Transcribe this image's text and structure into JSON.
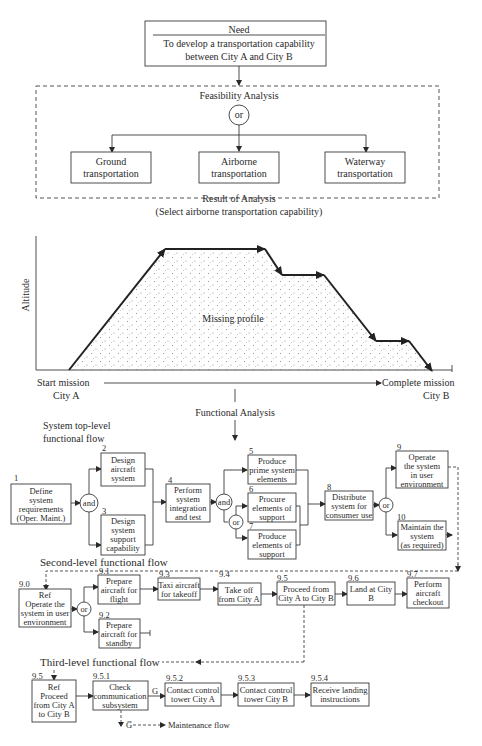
{
  "need": {
    "title": "Need",
    "line1": "To develop a transportation capability",
    "line2": "between City A and City B"
  },
  "feasibility": {
    "title": "Feasibility Analysis",
    "gate": "or",
    "options": [
      {
        "line1": "Ground",
        "line2": "transportation"
      },
      {
        "line1": "Airborne",
        "line2": "transportation"
      },
      {
        "line1": "Waterway",
        "line2": "transportation"
      }
    ],
    "result_title": "Result of Analysis",
    "result_detail": "(Select airborne transportation capability)"
  },
  "profile": {
    "y_axis_label": "Altitude",
    "area_label": "Missing profile",
    "start_line1": "Start mission",
    "start_line2": "City A",
    "end_line1": "Complete mission",
    "end_line2": "City B"
  },
  "functional_analysis": {
    "title": "Functional Analysis"
  },
  "top_level": {
    "title_line1": "System top-level",
    "title_line2": "functional flow",
    "gate_and_1": "and",
    "gate_and_2": "and",
    "gate_or_1": "or",
    "gate_or_2": "or",
    "blocks": [
      {
        "num": "1",
        "lines": [
          "Define",
          "system",
          "requirements",
          "(Oper. Maint.)"
        ]
      },
      {
        "num": "2",
        "lines": [
          "Design",
          "aircraft",
          "system"
        ]
      },
      {
        "num": "3",
        "lines": [
          "Design",
          "system",
          "support",
          "capability"
        ]
      },
      {
        "num": "4",
        "lines": [
          "Perform",
          "system",
          "integration",
          "and test"
        ]
      },
      {
        "num": "5",
        "lines": [
          "Produce",
          "prime system",
          "elements"
        ]
      },
      {
        "num": "6",
        "lines": [
          "Procure",
          "elements of",
          "support"
        ]
      },
      {
        "num": "7",
        "lines": [
          "Produce",
          "elements of",
          "support"
        ]
      },
      {
        "num": "8",
        "lines": [
          "Distribute",
          "system for",
          "consumer use"
        ]
      },
      {
        "num": "9",
        "lines": [
          "Operate",
          "the system",
          "in user",
          "environment"
        ]
      },
      {
        "num": "10",
        "lines": [
          "Maintain the",
          "system",
          "(as required)"
        ]
      }
    ]
  },
  "second_level": {
    "title": "Second-level functional flow",
    "gate_or": "or",
    "blocks": [
      {
        "num": "9.0",
        "lines": [
          "Ref",
          "Operate the",
          "system in user",
          "environment"
        ]
      },
      {
        "num": "9.1",
        "lines": [
          "Prepare",
          "aircraft for",
          "flight"
        ]
      },
      {
        "num": "9.2",
        "lines": [
          "Prepare",
          "aircraft for",
          "standby"
        ]
      },
      {
        "num": "9.3",
        "lines": [
          "Taxi aircraft",
          "for takeoff"
        ]
      },
      {
        "num": "9.4",
        "lines": [
          "Take off",
          "from City A"
        ]
      },
      {
        "num": "9.5",
        "lines": [
          "Proceed from",
          "City A to City B"
        ]
      },
      {
        "num": "9.6",
        "lines": [
          "Land at City",
          "B"
        ]
      },
      {
        "num": "9.7",
        "lines": [
          "Perform",
          "aircraft",
          "checkout"
        ]
      }
    ]
  },
  "third_level": {
    "title": "Third-level functional flow",
    "go_label": "G",
    "nogo_label": "G̅",
    "maintenance_label": "Maintenance flow",
    "blocks": [
      {
        "num": "9.5",
        "lines": [
          "Ref",
          "Proceed",
          "from City A",
          "to City B"
        ]
      },
      {
        "num": "9.5.1",
        "lines": [
          "Check",
          "communication",
          "subsystem"
        ]
      },
      {
        "num": "9.5.2",
        "lines": [
          "Contact control",
          "tower City A"
        ]
      },
      {
        "num": "9.5.3",
        "lines": [
          "Contact control",
          "tower City B"
        ]
      },
      {
        "num": "9.5.4",
        "lines": [
          "Receive landing",
          "instructions"
        ]
      }
    ]
  },
  "colors": {
    "ink": "#2a2a2a",
    "background": "#ffffff",
    "stipple": "#777777"
  }
}
